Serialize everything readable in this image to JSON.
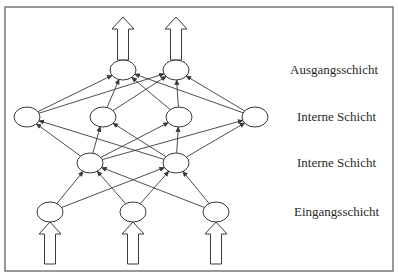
{
  "diagram": {
    "type": "neural-network",
    "frame": {
      "x": 5,
      "y": 7,
      "width": 388,
      "height": 264
    },
    "colors": {
      "stroke": "#3a3a3a",
      "frame": "#555555",
      "node_fill": "#ffffff",
      "text": "#2a2a2a"
    },
    "layers": [
      {
        "id": "output",
        "label": "Ausgangsschicht",
        "label_x": 290,
        "y": 70,
        "nodes_x": [
          123,
          176
        ],
        "arrows": "out"
      },
      {
        "id": "hidden2",
        "label": "Interne Schicht",
        "label_x": 297,
        "y": 117,
        "nodes_x": [
          27,
          103,
          179,
          255
        ]
      },
      {
        "id": "hidden1",
        "label": "Interne Schicht",
        "label_x": 297,
        "y": 163,
        "nodes_x": [
          90,
          176
        ]
      },
      {
        "id": "input",
        "label": "Eingangsschicht",
        "label_x": 294,
        "y": 212,
        "nodes_x": [
          50,
          133,
          216
        ],
        "arrows": "in"
      }
    ],
    "node_rx": 13,
    "node_ry": 10,
    "connections": "fully-connected-upward"
  },
  "labels": {
    "output": "Ausgangsschicht",
    "hidden2": "Interne Schicht",
    "hidden1": "Interne Schicht",
    "input": "Eingangsschicht"
  }
}
